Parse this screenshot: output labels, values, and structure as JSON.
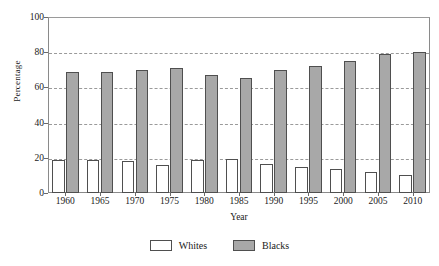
{
  "chart_data": {
    "type": "bar",
    "title": "",
    "xlabel": "Year",
    "ylabel": "Percentage",
    "categories": [
      "1960",
      "1965",
      "1970",
      "1975",
      "1980",
      "1985",
      "1990",
      "1995",
      "2000",
      "2005",
      "2010"
    ],
    "series": [
      {
        "name": "Whites",
        "color": "#ffffff",
        "values": [
          19,
          19,
          18,
          16,
          18.5,
          19.5,
          16.5,
          15,
          13.5,
          12,
          10.5
        ]
      },
      {
        "name": "Blacks",
        "color": "#a8a8a8",
        "values": [
          69,
          69,
          70,
          71,
          67,
          65.5,
          70,
          72,
          75,
          79,
          80
        ]
      }
    ],
    "ylim": [
      0,
      100
    ],
    "yticks": [
      0,
      20,
      40,
      60,
      80,
      100
    ],
    "ytick_labels": [
      "0",
      "20",
      "40",
      "60",
      "80",
      "100"
    ],
    "grid": true,
    "grid_style": "dashed-horizontal",
    "legend_position": "bottom-center"
  },
  "legend": {
    "items": [
      {
        "label": "Whites",
        "swatch": "white-square-swatch"
      },
      {
        "label": "Blacks",
        "swatch": "gray-square-swatch"
      }
    ]
  },
  "axes": {
    "y_title": "Percentage",
    "x_title": "Year"
  }
}
